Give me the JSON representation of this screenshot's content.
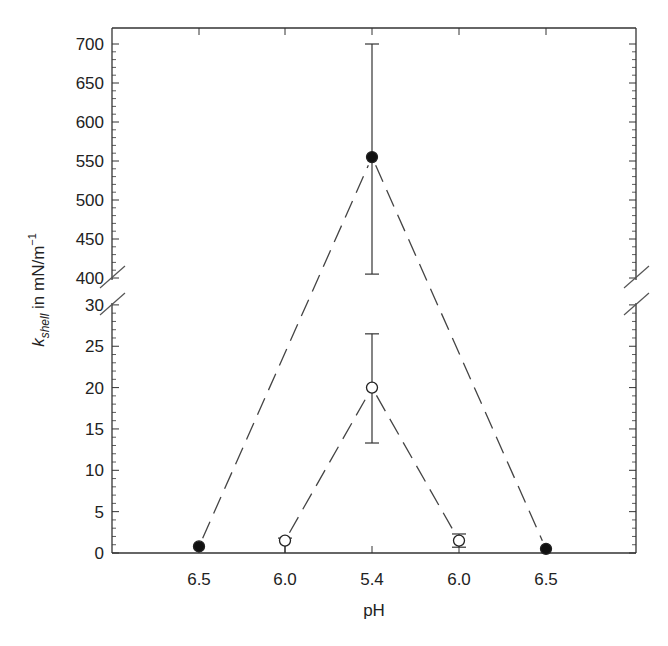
{
  "chart_data": {
    "type": "line",
    "title": "",
    "xlabel": "pH",
    "ylabel": "k_shell in mN/m^-1",
    "ylabel_parts": {
      "k": "k",
      "sub": "shell",
      "rest": " in mN/m",
      "sup": "−1"
    },
    "categories": [
      "6.5",
      "6.0",
      "5.4",
      "6.0",
      "6.5"
    ],
    "y_axis": {
      "broken": true,
      "lower_range": [
        0,
        30
      ],
      "upper_range": [
        400,
        700
      ],
      "lower_ticks": [
        0,
        5,
        10,
        15,
        20,
        25,
        30
      ],
      "upper_ticks": [
        400,
        450,
        500,
        550,
        600,
        650,
        700
      ]
    },
    "grid": false,
    "legend": null,
    "series": [
      {
        "name": "filled circles",
        "marker": "filled-circle",
        "line": "dashed",
        "points": [
          {
            "x_index": 0,
            "x": "6.5",
            "y": 0.8,
            "err_low": null,
            "err_high": null
          },
          {
            "x_index": 2,
            "x": "5.4",
            "y": 555,
            "err_low": 405,
            "err_high": 700
          },
          {
            "x_index": 4,
            "x": "6.5",
            "y": 0.5,
            "err_low": null,
            "err_high": null
          }
        ]
      },
      {
        "name": "open circles",
        "marker": "open-circle",
        "line": "dashed",
        "points": [
          {
            "x_index": 1,
            "x": "6.0",
            "y": 1.5,
            "err_low": 0,
            "err_high": 1.8
          },
          {
            "x_index": 2,
            "x": "5.4",
            "y": 20,
            "err_low": 13.3,
            "err_high": 26.5
          },
          {
            "x_index": 3,
            "x": "6.0",
            "y": 1.5,
            "err_low": 0.7,
            "err_high": 2.3
          }
        ]
      }
    ]
  }
}
